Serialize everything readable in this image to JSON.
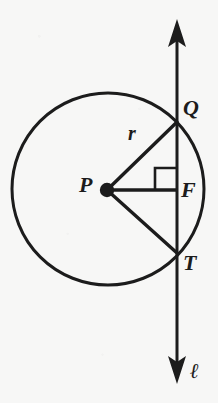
{
  "figure": {
    "kind": "circle-tangent-secant-geometry-diagram",
    "canvas": {
      "width": 218,
      "height": 403
    },
    "background_color": "#f7f7f6",
    "stroke_color": "#1c1c1c"
  },
  "circle": {
    "name": "circle-P",
    "center_x": 108,
    "center_y": 189,
    "radius": 96,
    "stroke_width": 3
  },
  "line": {
    "name": "line-ell",
    "x": 177,
    "top_y": 20,
    "bottom_y": 383,
    "stroke_width": 3,
    "label": "ℓ",
    "arrowheads": "both"
  },
  "points": {
    "P": {
      "label": "P",
      "x": 107,
      "y": 190,
      "dot_radius": 7,
      "role": "center"
    },
    "Q": {
      "label": "Q",
      "x": 177,
      "y": 122,
      "role": "upper-intersection"
    },
    "F": {
      "label": "F",
      "x": 177,
      "y": 190,
      "role": "foot-of-perpendicular"
    },
    "T": {
      "label": "T",
      "x": 177,
      "y": 253,
      "role": "lower-intersection"
    }
  },
  "segments": [
    {
      "name": "segment-PQ",
      "from": "P",
      "to": "Q",
      "label": "r",
      "label_x": 134,
      "label_y": 133
    },
    {
      "name": "segment-PF",
      "from": "P",
      "to": "F",
      "label": ""
    },
    {
      "name": "segment-PT",
      "from": "P",
      "to": "T",
      "label": ""
    }
  ],
  "right_angle_marker": {
    "name": "right-angle-marker-at-F",
    "vertex_x": 177,
    "vertex_y": 190,
    "size": 22
  },
  "labels": {
    "P": "P",
    "Q": "Q",
    "F": "F",
    "T": "T",
    "radius": "r",
    "line": "ℓ"
  }
}
